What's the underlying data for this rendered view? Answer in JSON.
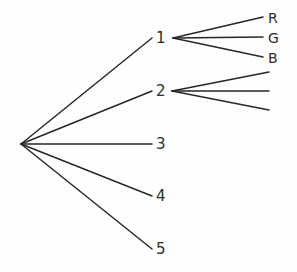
{
  "diagram": {
    "type": "tree",
    "title": "",
    "background_color": "#fefefe",
    "line_color": "#262626",
    "text_color": "#2b2b2b",
    "root": {
      "label": "",
      "x": 21,
      "y": 144
    },
    "level1_nodes": [
      {
        "id": "n1",
        "label": "1",
        "x": 160,
        "y": 38,
        "label_x": 156,
        "label_y": 31
      },
      {
        "id": "n2",
        "label": "2",
        "x": 160,
        "y": 91,
        "label_x": 156,
        "label_y": 84
      },
      {
        "id": "n3",
        "label": "3",
        "x": 160,
        "y": 144,
        "label_x": 156,
        "label_y": 137
      },
      {
        "id": "n4",
        "label": "4",
        "x": 160,
        "y": 196,
        "label_x": 156,
        "label_y": 189
      },
      {
        "id": "n5",
        "label": "5",
        "x": 160,
        "y": 249,
        "label_x": 156,
        "label_y": 242
      }
    ],
    "level2_groups": [
      {
        "parent": "n1",
        "origin_x": 173,
        "origin_y": 38,
        "leaves": [
          {
            "label": "R",
            "x": 263,
            "y": 17,
            "label_x": 268,
            "label_y": 10
          },
          {
            "label": "G",
            "x": 263,
            "y": 37,
            "label_x": 268,
            "label_y": 30
          },
          {
            "label": "B",
            "x": 263,
            "y": 57,
            "label_x": 268,
            "label_y": 50
          }
        ]
      },
      {
        "parent": "n2",
        "origin_x": 172,
        "origin_y": 91,
        "leaves": [
          {
            "label": "",
            "x": 269,
            "y": 72,
            "label_x": 0,
            "label_y": 0
          },
          {
            "label": "",
            "x": 269,
            "y": 91,
            "label_x": 0,
            "label_y": 0
          },
          {
            "label": "",
            "x": 269,
            "y": 110,
            "label_x": 0,
            "label_y": 0
          }
        ]
      }
    ]
  }
}
